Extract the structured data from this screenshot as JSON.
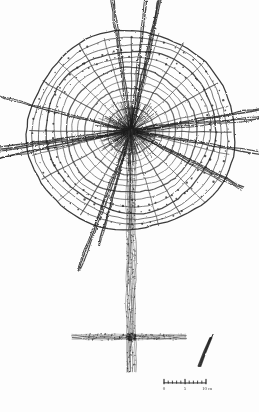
{
  "document": {
    "kind": "archaeological-site-plan",
    "header_caption": "Fig."
  },
  "plan": {
    "title": "",
    "structure_label": "",
    "center": {
      "x": 131,
      "y": 131
    },
    "ring_count": 14,
    "spoke_count": 24,
    "outer_radius": 104,
    "inner_radius": 8,
    "avenue": {
      "from_y": 131,
      "to_y": 372,
      "x": 131,
      "width": 9
    },
    "crossbar": {
      "y": 337,
      "x_start": 72,
      "x_end": 186,
      "thickness": 5
    },
    "long_spokes_deg": [
      195,
      200,
      258,
      262,
      285,
      352,
      6,
      12,
      80,
      84,
      100,
      118
    ]
  },
  "north_arrow": {
    "name": "north-arrow",
    "label": "N",
    "x": 205,
    "y": 352,
    "length": 30,
    "bearing_deg": 22
  },
  "scale_bar": {
    "name": "scale-bar",
    "x_start": 164,
    "x_end": 206,
    "y": 383,
    "tick_count": 11,
    "labels": [
      {
        "text": "0",
        "x": 164
      },
      {
        "text": "5",
        "x": 185
      },
      {
        "text": "10 m",
        "x": 207
      }
    ],
    "unit": "m",
    "max_value": 10
  },
  "colors": {
    "ink": "#3a3a3a",
    "ink_dark": "#1d1d1d",
    "ink_light": "#8a8a8a",
    "paper": "#fdfdfd",
    "faint": "#d8d8d8"
  }
}
